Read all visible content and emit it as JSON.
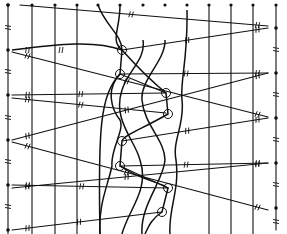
{
  "diagram": {
    "type": "line-diagram",
    "colors": {
      "ink": "#111111",
      "background": "#ffffff"
    },
    "left_axis": {
      "x": 8,
      "dots_y": [
        5,
        50,
        95,
        140,
        185,
        230
      ]
    },
    "right_axis": {
      "x": 276,
      "dots_y": [
        28,
        73,
        118,
        163,
        208
      ]
    },
    "top_dots_x": [
      8,
      32,
      55,
      77,
      98,
      120,
      143,
      165,
      187,
      209,
      231,
      253,
      276
    ],
    "straight_verticals_x": [
      32,
      55,
      77,
      209,
      231,
      253
    ],
    "circles": [
      {
        "x": 122,
        "y": 50
      },
      {
        "x": 120,
        "y": 74
      },
      {
        "x": 166,
        "y": 93
      },
      {
        "x": 168,
        "y": 114
      },
      {
        "x": 122,
        "y": 141
      },
      {
        "x": 120,
        "y": 166
      },
      {
        "x": 168,
        "y": 188
      },
      {
        "x": 162,
        "y": 212
      }
    ],
    "diagonals": [
      {
        "from": [
          20,
          5
        ],
        "to": [
          268,
          26
        ]
      },
      {
        "from": [
          12,
          50
        ],
        "to": [
          122,
          50
        ],
        "curved": true
      },
      {
        "from": [
          12,
          52
        ],
        "to": [
          268,
          117
        ]
      },
      {
        "from": [
          12,
          95
        ],
        "to": [
          166,
          93
        ]
      },
      {
        "from": [
          12,
          98
        ],
        "to": [
          166,
          113
        ]
      },
      {
        "from": [
          12,
          140
        ],
        "to": [
          268,
          73
        ]
      },
      {
        "from": [
          12,
          142
        ],
        "to": [
          268,
          210
        ]
      },
      {
        "from": [
          12,
          185
        ],
        "to": [
          168,
          188
        ]
      },
      {
        "from": [
          12,
          188
        ],
        "to": [
          268,
          163
        ]
      },
      {
        "from": [
          12,
          230
        ],
        "to": [
          162,
          212
        ]
      },
      {
        "from": [
          122,
          50
        ],
        "to": [
          268,
          28
        ]
      },
      {
        "from": [
          120,
          74
        ],
        "to": [
          268,
          73
        ]
      },
      {
        "from": [
          166,
          93
        ],
        "to": [
          120,
          74
        ]
      },
      {
        "from": [
          122,
          141
        ],
        "to": [
          268,
          118
        ]
      },
      {
        "from": [
          120,
          166
        ],
        "to": [
          268,
          163
        ]
      },
      {
        "from": [
          168,
          188
        ],
        "to": [
          120,
          166
        ]
      }
    ]
  }
}
